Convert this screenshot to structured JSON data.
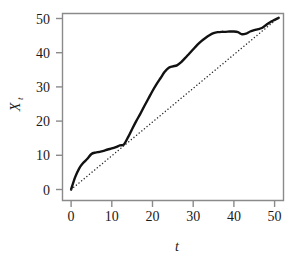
{
  "figure": {
    "background_color": "#ffffff",
    "axis_color": "#8a8a8a",
    "series_color": "#111111",
    "reference_color": "#2b2b2b"
  },
  "chart_data": {
    "type": "line",
    "title": "",
    "subtitle": "",
    "xlabel": "t",
    "ylabel": "X",
    "ylabel_subscript": "t",
    "xlim": [
      -1.5,
      53
    ],
    "ylim": [
      -2.5,
      52.5
    ],
    "xticks": [
      0,
      10,
      20,
      30,
      40,
      50
    ],
    "xticklabels": [
      "0",
      "10",
      "20",
      "30",
      "40",
      "50"
    ],
    "yticks": [
      0,
      10,
      20,
      30,
      40,
      50
    ],
    "yticklabels": [
      "0",
      "10",
      "20",
      "30",
      "40",
      "50"
    ],
    "grid": false,
    "legend": null,
    "series": [
      {
        "name": "X_t",
        "style": "solid",
        "linewidth": 2.4,
        "color": "#111111",
        "x": [
          0,
          1,
          2,
          3,
          4,
          5,
          6,
          7,
          8,
          9,
          10,
          11,
          12,
          13,
          14,
          15,
          16,
          17,
          18,
          19,
          20,
          21,
          22,
          23,
          24,
          25,
          26,
          27,
          28,
          29,
          30,
          31,
          32,
          33,
          34,
          35,
          36,
          37,
          38,
          39,
          40,
          41,
          42,
          43,
          44,
          45,
          46,
          47,
          48,
          49,
          50,
          51
        ],
        "y": [
          0.0,
          3.6,
          6.2,
          7.8,
          9.0,
          10.4,
          10.8,
          11.0,
          11.3,
          11.7,
          12.0,
          12.4,
          12.9,
          13.2,
          15.3,
          17.7,
          20.0,
          22.1,
          24.4,
          26.6,
          28.8,
          30.8,
          32.6,
          34.4,
          35.6,
          36.0,
          36.3,
          37.2,
          38.4,
          39.7,
          41.0,
          42.3,
          43.4,
          44.3,
          45.1,
          45.7,
          46.0,
          46.1,
          46.1,
          46.2,
          46.2,
          46.0,
          45.4,
          45.6,
          46.2,
          46.6,
          46.9,
          47.3,
          48.2,
          49.0,
          49.6,
          50.2
        ]
      },
      {
        "name": "reference_line",
        "style": "dotted",
        "linewidth": 1.4,
        "color": "#2b2b2b",
        "x": [
          0,
          51
        ],
        "y": [
          0,
          50.3
        ]
      }
    ],
    "annotations": []
  }
}
